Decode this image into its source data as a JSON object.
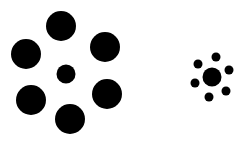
{
  "figure": {
    "type": "ebbinghaus-illusion",
    "background": "#ffffff",
    "fill": "#000000",
    "groups": [
      {
        "name": "left-group-large-surround",
        "center": {
          "cx": 66,
          "cy": 74,
          "r": 9.5
        },
        "surround": [
          {
            "cx": 61,
            "cy": 26,
            "r": 15
          },
          {
            "cx": 105,
            "cy": 47,
            "r": 15
          },
          {
            "cx": 107,
            "cy": 94,
            "r": 15
          },
          {
            "cx": 70,
            "cy": 119,
            "r": 15
          },
          {
            "cx": 31,
            "cy": 100,
            "r": 15
          },
          {
            "cx": 26,
            "cy": 54,
            "r": 15
          }
        ]
      },
      {
        "name": "right-group-small-surround",
        "center": {
          "cx": 212,
          "cy": 77,
          "r": 9.5
        },
        "surround": [
          {
            "cx": 216,
            "cy": 57,
            "r": 4.5
          },
          {
            "cx": 229,
            "cy": 70,
            "r": 4.5
          },
          {
            "cx": 226,
            "cy": 91,
            "r": 4.5
          },
          {
            "cx": 209,
            "cy": 97,
            "r": 4.5
          },
          {
            "cx": 195,
            "cy": 83,
            "r": 4.5
          },
          {
            "cx": 198,
            "cy": 64,
            "r": 4.5
          }
        ]
      }
    ]
  }
}
